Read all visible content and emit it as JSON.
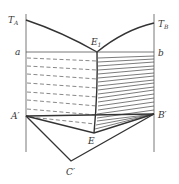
{
  "diagram": {
    "type": "phase-diagram",
    "labels": {
      "TA": {
        "main": "T",
        "sub": "A"
      },
      "TB": {
        "main": "T",
        "sub": "B"
      },
      "E1": {
        "main": "E",
        "sub": "1"
      },
      "a": "a",
      "b": "b",
      "A_prime": "A′",
      "B_prime": "B′",
      "E": "E",
      "C_prime": "C′"
    },
    "colors": {
      "line": "#333333",
      "background": "#ffffff"
    }
  }
}
